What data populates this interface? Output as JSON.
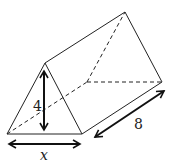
{
  "figure": {
    "type": "triangular-prism",
    "labels": {
      "height": "4",
      "length": "8",
      "base": "x"
    },
    "colors": {
      "stroke": "#222222",
      "background": "#ffffff"
    }
  }
}
